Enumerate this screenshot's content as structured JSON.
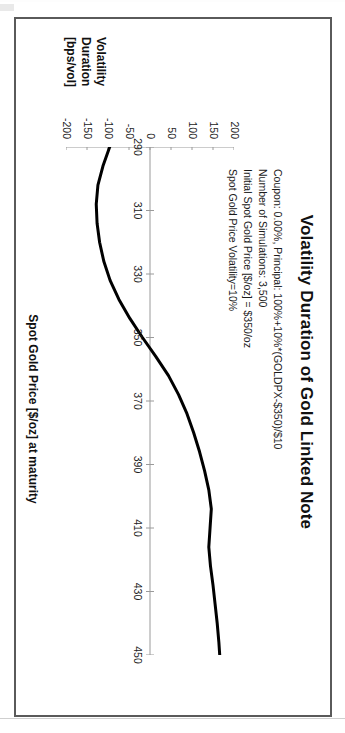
{
  "chart_data": {
    "type": "line",
    "title": "Volatility Duration of Gold Linked Note",
    "xlabel": "Spot Gold Price [$/oz] at maturity",
    "ylabel_lines": [
      "Volatility",
      "Duration",
      "[bps/vol]"
    ],
    "ylabel": "Volatility Duration [bps/vol]",
    "annotations": [
      "Coupon: 0.00%, Principal: 100%+10%*(GOLDPX-$350)/$10",
      "Number of Simulations: 3,500",
      "Initial Spot Gold Price [$/oz] = $350/oz",
      "Spot Gold Price Volatility=10%"
    ],
    "xlim": [
      290,
      450
    ],
    "ylim": [
      -200,
      200
    ],
    "xticks": [
      290,
      310,
      330,
      350,
      370,
      390,
      410,
      430,
      450
    ],
    "xtick_labels": [
      "290",
      "310",
      "330",
      "350",
      "370",
      "390",
      "410",
      "430",
      "450"
    ],
    "yticks": [
      200,
      150,
      100,
      50,
      0,
      -50,
      -100,
      -150,
      -200
    ],
    "ytick_labels": [
      "200",
      "150",
      "100",
      "50",
      "0",
      "-50",
      "-100",
      "-150",
      "-200"
    ],
    "grid": false,
    "legend": false,
    "line_color": "#000000",
    "line_width": 3,
    "axis_color": "#9a9a9a",
    "series": [
      {
        "name": "Volatility Duration",
        "x": [
          290,
          296,
          302,
          308,
          314,
          320,
          326,
          332,
          338,
          344,
          350,
          356,
          362,
          368,
          374,
          380,
          386,
          392,
          398,
          404,
          410,
          416,
          422,
          428,
          434,
          440,
          446,
          450
        ],
        "values": [
          -96,
          -112,
          -124,
          -128,
          -126,
          -120,
          -110,
          -95,
          -74,
          -48,
          -18,
          14,
          44,
          68,
          88,
          104,
          118,
          130,
          140,
          146,
          143,
          140,
          144,
          150,
          155,
          160,
          164,
          166
        ]
      }
    ]
  },
  "figure": {
    "frame_border_color": "#5a5a5a",
    "background": "#ffffff"
  }
}
